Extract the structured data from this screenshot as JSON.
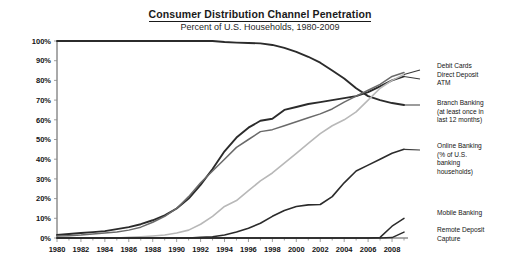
{
  "chart_data": {
    "type": "line",
    "title": "Consumer Distribution Channel Penetration",
    "subtitle": "Percent of U.S. Households, 1980-2009",
    "xlabel": "",
    "ylabel": "",
    "xlim": [
      1980,
      2009
    ],
    "ylim": [
      0,
      100
    ],
    "grid": false,
    "legend_position": "right-inline-annotations",
    "y_ticks": [
      "0%",
      "10%",
      "20%",
      "30%",
      "40%",
      "50%",
      "60%",
      "70%",
      "80%",
      "90%",
      "100%"
    ],
    "y_tick_values": [
      0,
      10,
      20,
      30,
      40,
      50,
      60,
      70,
      80,
      90,
      100
    ],
    "x_ticks": [
      "1980",
      "1982",
      "1984",
      "1986",
      "1988",
      "1990",
      "1992",
      "1994",
      "1996",
      "1998",
      "2000",
      "2002",
      "2004",
      "2006",
      "2008"
    ],
    "x_tick_values": [
      1980,
      1982,
      1984,
      1986,
      1988,
      1990,
      1992,
      1994,
      1996,
      1998,
      2000,
      2002,
      2004,
      2006,
      2008
    ],
    "x": [
      1980,
      1981,
      1982,
      1983,
      1984,
      1985,
      1986,
      1987,
      1988,
      1989,
      1990,
      1991,
      1992,
      1993,
      1994,
      1995,
      1996,
      1997,
      1998,
      1999,
      2000,
      2001,
      2002,
      2003,
      2004,
      2005,
      2006,
      2007,
      2008,
      2009
    ],
    "series": [
      {
        "name": "Branch Banking",
        "label": "Branch Banking (at least once in last 12 months)",
        "color": "#2b2b2b",
        "width": 1.9,
        "values": [
          100,
          100,
          100,
          100,
          100,
          100,
          100,
          100,
          100,
          100,
          100,
          100,
          100,
          100,
          99.5,
          99.2,
          99,
          98.8,
          98,
          96.5,
          94.5,
          92,
          89,
          85,
          81,
          76,
          72,
          70,
          68.5,
          67.5
        ]
      },
      {
        "name": "ATM",
        "label": "ATM",
        "color": "#2b2b2b",
        "width": 1.9,
        "values": [
          1.5,
          2,
          2.5,
          3,
          3.5,
          4.5,
          5.5,
          7,
          9,
          11.5,
          15,
          20,
          27,
          35,
          44,
          51,
          56,
          59.5,
          60.5,
          65,
          66.5,
          68,
          69,
          70,
          71,
          72,
          74,
          77,
          80,
          82
        ]
      },
      {
        "name": "Direct Deposit",
        "label": "Direct Deposit",
        "color": "#6a6a6a",
        "width": 1.5,
        "values": [
          1,
          1.2,
          1.5,
          2,
          2.5,
          3,
          4,
          5.5,
          8,
          11,
          15,
          21,
          28,
          34,
          40,
          46,
          50,
          54,
          55,
          57,
          59,
          61,
          63,
          65.5,
          69,
          72,
          75,
          78,
          82,
          84
        ]
      },
      {
        "name": "Debit Cards",
        "label": "Debit Cards",
        "color": "#b8b8b8",
        "width": 1.6,
        "values": [
          0,
          0,
          0,
          0,
          0,
          0,
          0.3,
          0.6,
          1,
          1.5,
          2.5,
          4,
          7,
          11,
          16,
          19,
          24,
          29,
          33,
          38,
          43,
          48,
          53,
          57,
          60,
          64,
          70,
          76,
          80,
          83
        ]
      },
      {
        "name": "Online Banking",
        "label": "Online Banking (% of U.S. banking households)",
        "color": "#2b2b2b",
        "width": 1.6,
        "values": [
          0,
          0,
          0,
          0,
          0,
          0,
          0,
          0,
          0,
          0,
          0,
          0,
          0.3,
          0.6,
          1.5,
          3,
          5,
          7.5,
          11,
          14,
          16,
          16.8,
          17,
          21,
          28,
          34,
          37,
          40,
          43,
          45
        ]
      },
      {
        "name": "Mobile Banking",
        "label": "Mobile Banking",
        "color": "#2b2b2b",
        "width": 1.5,
        "values": [
          0,
          0,
          0,
          0,
          0,
          0,
          0,
          0,
          0,
          0,
          0,
          0,
          0,
          0,
          0,
          0,
          0,
          0,
          0,
          0,
          0,
          0,
          0,
          0,
          0,
          0,
          0,
          0.3,
          6,
          10
        ]
      },
      {
        "name": "Remote Deposit Capture",
        "label": "Remote Deposit Capture",
        "color": "#2b2b2b",
        "width": 1.5,
        "values": [
          0,
          0,
          0,
          0,
          0,
          0,
          0,
          0,
          0,
          0,
          0,
          0,
          0,
          0,
          0,
          0,
          0,
          0,
          0,
          0,
          0,
          0,
          0,
          0,
          0,
          0,
          0,
          0,
          0.2,
          3
        ]
      }
    ],
    "annotations": [
      {
        "id": "debit-cards",
        "text": "Debit Cards"
      },
      {
        "id": "direct-deposit",
        "text": "Direct Deposit"
      },
      {
        "id": "atm",
        "text": "ATM"
      },
      {
        "id": "branch-banking-1",
        "text": "Branch Banking"
      },
      {
        "id": "branch-banking-2",
        "text": "(at least once in"
      },
      {
        "id": "branch-banking-3",
        "text": "last 12 months)"
      },
      {
        "id": "online-banking-1",
        "text": "Online Banking"
      },
      {
        "id": "online-banking-2",
        "text": "(% of U.S."
      },
      {
        "id": "online-banking-3",
        "text": "banking"
      },
      {
        "id": "online-banking-4",
        "text": "households)"
      },
      {
        "id": "mobile-banking",
        "text": "Mobile Banking"
      },
      {
        "id": "remote-deposit-1",
        "text": "Remote Deposit"
      },
      {
        "id": "remote-deposit-2",
        "text": "Capture"
      }
    ]
  }
}
